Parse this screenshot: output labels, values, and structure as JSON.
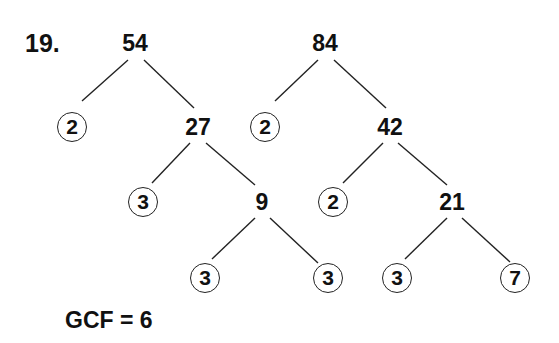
{
  "problem_number": "19.",
  "trees": [
    {
      "root": "54",
      "nodes": [
        {
          "id": "54",
          "value": "54",
          "circled": false,
          "x": 135,
          "y": 43
        },
        {
          "id": "54-l",
          "value": "2",
          "circled": true,
          "x": 72,
          "y": 127
        },
        {
          "id": "27",
          "value": "27",
          "circled": false,
          "x": 198,
          "y": 127
        },
        {
          "id": "27-l",
          "value": "3",
          "circled": true,
          "x": 143,
          "y": 202
        },
        {
          "id": "9",
          "value": "9",
          "circled": false,
          "x": 262,
          "y": 202
        },
        {
          "id": "9-l",
          "value": "3",
          "circled": true,
          "x": 205,
          "y": 278
        },
        {
          "id": "9-r",
          "value": "3",
          "circled": true,
          "x": 328,
          "y": 278
        }
      ]
    },
    {
      "root": "84",
      "nodes": [
        {
          "id": "84",
          "value": "84",
          "circled": false,
          "x": 325,
          "y": 43
        },
        {
          "id": "84-l",
          "value": "2",
          "circled": true,
          "x": 265,
          "y": 127
        },
        {
          "id": "42",
          "value": "42",
          "circled": false,
          "x": 390,
          "y": 127
        },
        {
          "id": "42-l",
          "value": "2",
          "circled": true,
          "x": 333,
          "y": 202
        },
        {
          "id": "21",
          "value": "21",
          "circled": false,
          "x": 452,
          "y": 202
        },
        {
          "id": "21-l",
          "value": "3",
          "circled": true,
          "x": 397,
          "y": 278
        },
        {
          "id": "21-r",
          "value": "7",
          "circled": true,
          "x": 515,
          "y": 278
        }
      ]
    }
  ],
  "answer": "GCF = 6"
}
